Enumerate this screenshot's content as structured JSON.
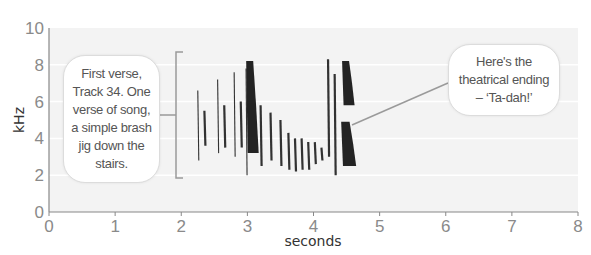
{
  "chart_data": {
    "type": "heatmap",
    "subtype": "spectrogram",
    "title": "",
    "xlabel": "seconds",
    "ylabel": "kHz",
    "xlim": [
      0,
      8
    ],
    "ylim": [
      0,
      10
    ],
    "x_ticks": [
      0,
      1,
      2,
      3,
      4,
      5,
      6,
      7,
      8
    ],
    "y_ticks": [
      0,
      2,
      4,
      6,
      8,
      10
    ],
    "grid": true,
    "grid_lines_y": [
      2,
      4,
      6,
      8
    ],
    "background": "#f3f3f3",
    "ink_color": "#111111",
    "bracket": {
      "x": 1.95,
      "y_from": 2,
      "y_to": 8
    },
    "annotations": [
      {
        "id": "left",
        "text": "First verse,\nTrack 34. One\nverse of song,\na simple brash\njig down the\nstairs.",
        "points_to": {
          "x": 1.95,
          "y": 5
        }
      },
      {
        "id": "right",
        "text": "Here's the\ntheatrical ending\n– ‘Ta-dah!’",
        "points_to": {
          "x": 4.6,
          "y": 4.8
        }
      }
    ],
    "segments": [
      {
        "t": 2.25,
        "f_low": 2.8,
        "f_high": 6.6,
        "weight": 1
      },
      {
        "t": 2.35,
        "f_low": 3.6,
        "f_high": 5.5,
        "weight": 2
      },
      {
        "t": 2.55,
        "f_low": 3.2,
        "f_high": 7.2,
        "weight": 1
      },
      {
        "t": 2.65,
        "f_low": 3.5,
        "f_high": 5.8,
        "weight": 2
      },
      {
        "t": 2.8,
        "f_low": 3.0,
        "f_high": 7.6,
        "weight": 1
      },
      {
        "t": 2.9,
        "f_low": 3.5,
        "f_high": 6.0,
        "weight": 2
      },
      {
        "t": 2.98,
        "f_low": 2.0,
        "f_high": 7.8,
        "weight": 1
      },
      {
        "t": 3.05,
        "f_low": 3.2,
        "f_high": 8.2,
        "weight": 5
      },
      {
        "t": 3.2,
        "f_low": 2.5,
        "f_high": 5.8,
        "weight": 2
      },
      {
        "t": 3.35,
        "f_low": 2.8,
        "f_high": 5.4,
        "weight": 2
      },
      {
        "t": 3.5,
        "f_low": 2.5,
        "f_high": 5.0,
        "weight": 2
      },
      {
        "t": 3.62,
        "f_low": 2.3,
        "f_high": 4.3,
        "weight": 2
      },
      {
        "t": 3.72,
        "f_low": 2.2,
        "f_high": 4.0,
        "weight": 2
      },
      {
        "t": 3.82,
        "f_low": 2.3,
        "f_high": 4.0,
        "weight": 2
      },
      {
        "t": 3.92,
        "f_low": 2.3,
        "f_high": 3.8,
        "weight": 2
      },
      {
        "t": 4.02,
        "f_low": 2.6,
        "f_high": 3.8,
        "weight": 2
      },
      {
        "t": 4.12,
        "f_low": 2.8,
        "f_high": 3.5,
        "weight": 2
      },
      {
        "t": 4.22,
        "f_low": 3.0,
        "f_high": 8.3,
        "weight": 2
      },
      {
        "t": 4.32,
        "f_low": 2.0,
        "f_high": 7.5,
        "weight": 2
      },
      {
        "t": 4.5,
        "f_low": 5.8,
        "f_high": 8.2,
        "weight": 5
      },
      {
        "t": 4.5,
        "f_low": 2.5,
        "f_high": 4.9,
        "weight": 6
      }
    ]
  },
  "axes": {
    "y_label": "kHz",
    "x_label": "seconds",
    "y_ticks": [
      "0",
      "2",
      "4",
      "6",
      "8",
      "10"
    ],
    "x_ticks": [
      "0",
      "1",
      "2",
      "3",
      "4",
      "5",
      "6",
      "7",
      "8"
    ]
  },
  "callouts": {
    "left": "First verse,\nTrack 34. One\nverse of song,\na simple brash\njig down the\nstairs.",
    "right": "Here's the\ntheatrical ending\n– ‘Ta-dah!’"
  }
}
